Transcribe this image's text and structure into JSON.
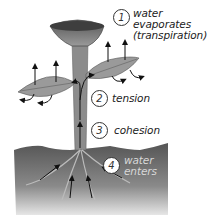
{
  "diagram": {
    "type": "plant water transport (transpiration-cohesion-tension)",
    "steps": [
      {
        "number": "1",
        "label_lines": [
          "water",
          "evaporates",
          "(transpiration)"
        ]
      },
      {
        "number": "2",
        "label_lines": [
          "tension"
        ]
      },
      {
        "number": "3",
        "label_lines": [
          "cohesion"
        ]
      },
      {
        "number": "4",
        "label_lines": [
          "water",
          "enters"
        ]
      }
    ],
    "colors": {
      "soil_top": "#5a5a5a",
      "soil_bottom": "#d0d0d0",
      "stem": "#8c8c8c",
      "leaf": "#9a9a9a",
      "flower": "#6e6e6e",
      "arrow": "#111111"
    }
  }
}
